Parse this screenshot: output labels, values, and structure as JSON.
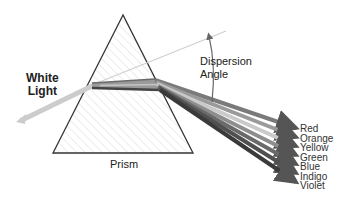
{
  "diagram": {
    "labels": {
      "white_light_line1": "White",
      "white_light_line2": "Light",
      "dispersion_line1": "Dispersion",
      "dispersion_line2": "Angle",
      "prism": "Prism"
    },
    "spectrum": [
      {
        "name": "Red",
        "shade": "#7a7a7a"
      },
      {
        "name": "Orange",
        "shade": "#9a9a9a"
      },
      {
        "name": "Yellow",
        "shade": "#c8c8c8"
      },
      {
        "name": "Green",
        "shade": "#8e8e8e"
      },
      {
        "name": "Blue",
        "shade": "#6a6a6a"
      },
      {
        "name": "Indigo",
        "shade": "#4e4e4e"
      },
      {
        "name": "Violet",
        "shade": "#3a3a3a"
      }
    ],
    "colors": {
      "prism_outline": "#333333",
      "hatch": "#d6d6d6",
      "incoming_beam": "#c8c8c8",
      "reference_line": "#cfcfcf",
      "angle_arrow": "#666666"
    }
  }
}
